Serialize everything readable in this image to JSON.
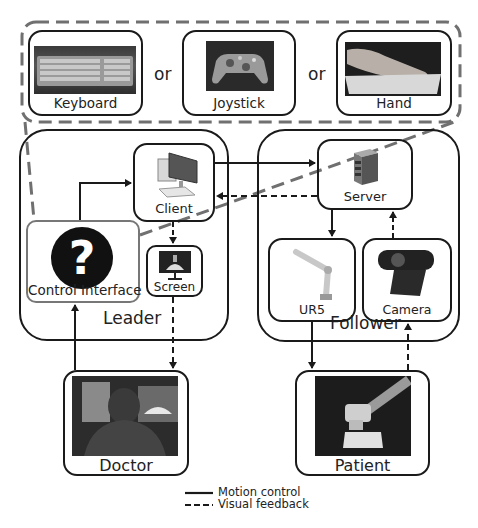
{
  "inputs": {
    "options": [
      {
        "label": "Keyboard",
        "icon": "keyboard-photo"
      },
      {
        "label": "Joystick",
        "icon": "gamepad-photo"
      },
      {
        "label": "Hand",
        "icon": "hand-photo"
      }
    ],
    "separator": "or"
  },
  "leader": {
    "title": "Leader",
    "client": {
      "label": "Client",
      "icon": "desktop-computer-icon"
    },
    "screen": {
      "label": "Screen",
      "icon": "monitor-icon"
    },
    "control_interface": {
      "label": "Control Interface",
      "icon": "question-mark-icon",
      "glyph": "?"
    }
  },
  "follower": {
    "title": "Follower",
    "server": {
      "label": "Server",
      "icon": "server-tower-icon"
    },
    "ur5": {
      "label": "UR5",
      "icon": "robot-arm-icon"
    },
    "camera": {
      "label": "Camera",
      "icon": "webcam-icon"
    }
  },
  "actors": {
    "doctor": {
      "label": "Doctor",
      "icon": "doctor-photo"
    },
    "patient": {
      "label": "Patient",
      "icon": "patient-phantom-photo"
    }
  },
  "legend": {
    "items": [
      {
        "label": "Motion control",
        "style": "solid"
      },
      {
        "label": "Visual feedback",
        "style": "dashed"
      }
    ]
  },
  "colors": {
    "stroke": "#1a1a1a",
    "highlight_dashed": "#707070",
    "photo_dark": "#2a2a2a"
  }
}
